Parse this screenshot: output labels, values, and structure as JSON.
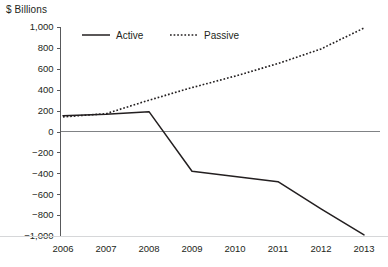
{
  "chart_data": {
    "type": "line",
    "title": "",
    "subtitle": "",
    "xlabel": "",
    "ylabel": "$ Billions",
    "x": [
      2006,
      2007,
      2008,
      2009,
      2010,
      2011,
      2012,
      2013
    ],
    "categories": [
      "2006",
      "2007",
      "2008",
      "2009",
      "2010",
      "2011",
      "2012",
      "2013"
    ],
    "series": [
      {
        "name": "Active",
        "style": "solid",
        "values": [
          150,
          165,
          190,
          -380,
          -430,
          -480,
          -740,
          -990
        ]
      },
      {
        "name": "Passive",
        "style": "dotted",
        "values": [
          140,
          170,
          300,
          420,
          530,
          650,
          790,
          990
        ]
      }
    ],
    "ylim": [
      -1000,
      1000
    ],
    "yticks": [
      1000,
      800,
      600,
      400,
      200,
      0,
      -200,
      -400,
      -600,
      -800,
      -1000
    ],
    "ytick_labels": [
      "1,000",
      "800",
      "600",
      "400",
      "200",
      "0",
      "−200",
      "−400",
      "−600",
      "−800",
      "−1,000"
    ],
    "xtick_labels": [
      "2006",
      "2007",
      "2008",
      "2009",
      "2010",
      "2011",
      "2012",
      "2013"
    ],
    "grid": false,
    "zero_line": true,
    "legend_position": "top-center",
    "colors": {
      "series_line": "#231f20",
      "axis": "#58595b",
      "zero_line": "#808285",
      "bottom_rule": "#d6d7d9",
      "text": "#231f20",
      "background": "#ffffff"
    }
  },
  "legend": {
    "items": [
      {
        "label": "Active",
        "style": "solid"
      },
      {
        "label": "Passive",
        "style": "dotted"
      }
    ]
  }
}
